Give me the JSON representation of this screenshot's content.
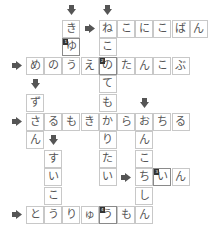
{
  "puzzle": {
    "type": "crossword",
    "colors": {
      "cell_border": "#c8c8c8",
      "highlight_border": "#8a8a8a",
      "arrow": "#555555",
      "text": "#555555"
    },
    "cells": [
      {
        "r": 0,
        "c": 2,
        "ch": "き"
      },
      {
        "r": 0,
        "c": 4,
        "ch": "ね"
      },
      {
        "r": 0,
        "c": 5,
        "ch": "こ"
      },
      {
        "r": 0,
        "c": 6,
        "ch": "に"
      },
      {
        "r": 0,
        "c": 7,
        "ch": "こ"
      },
      {
        "r": 0,
        "c": 8,
        "ch": "ば"
      },
      {
        "r": 0,
        "c": 9,
        "ch": "ん"
      },
      {
        "r": 1,
        "c": 2,
        "ch": "ゆ",
        "num": "1"
      },
      {
        "r": 1,
        "c": 4,
        "ch": "こ"
      },
      {
        "r": 2,
        "c": 0,
        "ch": "め"
      },
      {
        "r": 2,
        "c": 1,
        "ch": "の"
      },
      {
        "r": 2,
        "c": 2,
        "ch": "う"
      },
      {
        "r": 2,
        "c": 3,
        "ch": "え"
      },
      {
        "r": 2,
        "c": 4,
        "ch": "の",
        "num": "2"
      },
      {
        "r": 2,
        "c": 5,
        "ch": "た"
      },
      {
        "r": 2,
        "c": 6,
        "ch": "ん"
      },
      {
        "r": 2,
        "c": 7,
        "ch": "こ"
      },
      {
        "r": 2,
        "c": 8,
        "ch": "ぶ"
      },
      {
        "r": 3,
        "c": 4,
        "ch": "て"
      },
      {
        "r": 4,
        "c": 0,
        "ch": "ず"
      },
      {
        "r": 4,
        "c": 4,
        "ch": "も"
      },
      {
        "r": 5,
        "c": 0,
        "ch": "さ"
      },
      {
        "r": 5,
        "c": 1,
        "ch": "る"
      },
      {
        "r": 5,
        "c": 2,
        "ch": "も"
      },
      {
        "r": 5,
        "c": 3,
        "ch": "き"
      },
      {
        "r": 5,
        "c": 4,
        "ch": "か"
      },
      {
        "r": 5,
        "c": 5,
        "ch": "ら"
      },
      {
        "r": 5,
        "c": 6,
        "ch": "お"
      },
      {
        "r": 5,
        "c": 7,
        "ch": "ち"
      },
      {
        "r": 5,
        "c": 8,
        "ch": "る"
      },
      {
        "r": 6,
        "c": 0,
        "ch": "ん"
      },
      {
        "r": 6,
        "c": 4,
        "ch": "り"
      },
      {
        "r": 6,
        "c": 6,
        "ch": "ん"
      },
      {
        "r": 7,
        "c": 1,
        "ch": "す"
      },
      {
        "r": 7,
        "c": 4,
        "ch": "た"
      },
      {
        "r": 7,
        "c": 6,
        "ch": "こ"
      },
      {
        "r": 8,
        "c": 1,
        "ch": "い"
      },
      {
        "r": 8,
        "c": 4,
        "ch": "い"
      },
      {
        "r": 8,
        "c": 6,
        "ch": "ち"
      },
      {
        "r": 8,
        "c": 7,
        "ch": "い",
        "num": "3"
      },
      {
        "r": 8,
        "c": 8,
        "ch": "ん"
      },
      {
        "r": 9,
        "c": 1,
        "ch": "こ"
      },
      {
        "r": 9,
        "c": 6,
        "ch": "し"
      },
      {
        "r": 10,
        "c": 0,
        "ch": "と"
      },
      {
        "r": 10,
        "c": 1,
        "ch": "う"
      },
      {
        "r": 10,
        "c": 2,
        "ch": "り"
      },
      {
        "r": 10,
        "c": 3,
        "ch": "ゅ"
      },
      {
        "r": 10,
        "c": 4,
        "ch": "う",
        "num": "4"
      },
      {
        "r": 10,
        "c": 5,
        "ch": "も"
      },
      {
        "r": 10,
        "c": 6,
        "ch": "ん"
      }
    ],
    "arrows": [
      {
        "r": -1,
        "c": 2,
        "dir": "down"
      },
      {
        "r": -1,
        "c": 4,
        "dir": "down"
      },
      {
        "r": 0,
        "c": 3,
        "dir": "right"
      },
      {
        "r": 2,
        "c": -1,
        "dir": "right"
      },
      {
        "r": 3,
        "c": 0,
        "dir": "down"
      },
      {
        "r": 4,
        "c": 6,
        "dir": "down"
      },
      {
        "r": 5,
        "c": -1,
        "dir": "right"
      },
      {
        "r": 6,
        "c": 1,
        "dir": "down"
      },
      {
        "r": 8,
        "c": 5,
        "dir": "right"
      },
      {
        "r": 10,
        "c": -1,
        "dir": "right"
      }
    ],
    "words": [
      {
        "dir": "across",
        "text": "ねこにこばん"
      },
      {
        "dir": "down",
        "text": "きゆう"
      },
      {
        "dir": "down",
        "text": "ねこのてもかりたい"
      },
      {
        "dir": "across",
        "text": "めのうえのたんこぶ"
      },
      {
        "dir": "down",
        "text": "ずさん"
      },
      {
        "dir": "across",
        "text": "さるもきからおちる"
      },
      {
        "dir": "down",
        "text": "すいこう"
      },
      {
        "dir": "down",
        "text": "おんこちしん"
      },
      {
        "dir": "across",
        "text": "ちいん"
      },
      {
        "dir": "across",
        "text": "とうりゅうもん"
      }
    ]
  }
}
